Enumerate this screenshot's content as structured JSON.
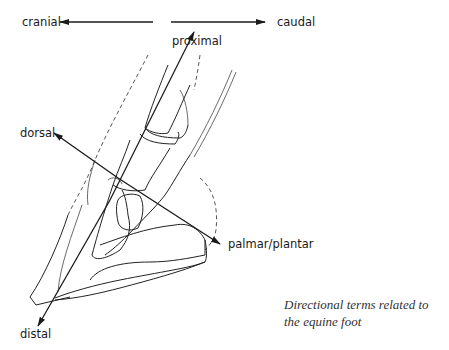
{
  "diagram": {
    "labels": {
      "cranial": "cranial",
      "caudal": "caudal",
      "proximal": "proximal",
      "dorsal": "dorsal",
      "palmar_plantar": "palmar/plantar",
      "distal": "distal"
    },
    "caption": {
      "line1": "Directional terms related to",
      "line2": "the equine foot"
    },
    "colors": {
      "ink": "#1a1a1a",
      "background": "#ffffff"
    }
  }
}
